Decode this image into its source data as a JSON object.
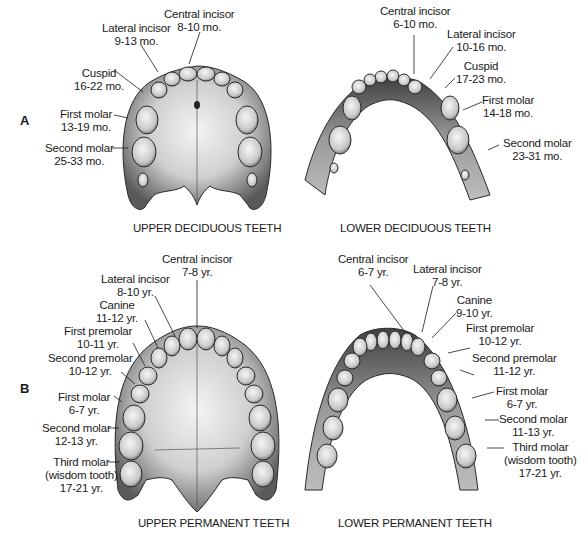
{
  "sections": {
    "A": {
      "letter": "A",
      "upper": {
        "title": "UPPER DECIDUOUS TEETH",
        "teeth": [
          {
            "name": "Central incisor",
            "age": "8-10 mo."
          },
          {
            "name": "Lateral incisor",
            "age": "9-13 mo."
          },
          {
            "name": "Cuspid",
            "age": "16-22 mo."
          },
          {
            "name": "First molar",
            "age": "13-19 mo."
          },
          {
            "name": "Second molar",
            "age": "25-33 mo."
          }
        ]
      },
      "lower": {
        "title": "LOWER DECIDUOUS TEETH",
        "teeth": [
          {
            "name": "Central incisor",
            "age": "6-10 mo."
          },
          {
            "name": "Lateral incisor",
            "age": "10-16 mo."
          },
          {
            "name": "Cuspid",
            "age": "17-23 mo."
          },
          {
            "name": "First molar",
            "age": "14-18 mo."
          },
          {
            "name": "Second molar",
            "age": "23-31 mo."
          }
        ]
      }
    },
    "B": {
      "letter": "B",
      "upper": {
        "title": "UPPER PERMANENT TEETH",
        "teeth": [
          {
            "name": "Central incisor",
            "age": "7-8 yr."
          },
          {
            "name": "Lateral incisor",
            "age": "8-10 yr."
          },
          {
            "name": "Canine",
            "age": "11-12 yr."
          },
          {
            "name": "First premolar",
            "age": "10-11 yr."
          },
          {
            "name": "Second premolar",
            "age": "10-12 yr."
          },
          {
            "name": "First molar",
            "age": "6-7 yr."
          },
          {
            "name": "Second molar",
            "age": "12-13 yr."
          },
          {
            "name": "Third molar",
            "name2": "(wisdom tooth)",
            "age": "17-21 yr."
          }
        ]
      },
      "lower": {
        "title": "LOWER PERMANENT TEETH",
        "teeth": [
          {
            "name": "Central incisor",
            "age": "6-7 yr."
          },
          {
            "name": "Lateral incisor",
            "age": "7-8 yr."
          },
          {
            "name": "Canine",
            "age": "9-10 yr."
          },
          {
            "name": "First premolar",
            "age": "10-12 yr."
          },
          {
            "name": "Second premolar",
            "age": "11-12 yr."
          },
          {
            "name": "First molar",
            "age": "6-7 yr."
          },
          {
            "name": "Second molar",
            "age": "11-13 yr."
          },
          {
            "name": "Third molar",
            "name2": "(wisdom tooth)",
            "age": "17-21 yr."
          }
        ]
      }
    }
  },
  "colors": {
    "ink": "#1a1a1a",
    "bone": "#d9d9d9",
    "bone_dark": "#6e6e6e",
    "tooth": "#ececec",
    "background": "#ffffff"
  }
}
